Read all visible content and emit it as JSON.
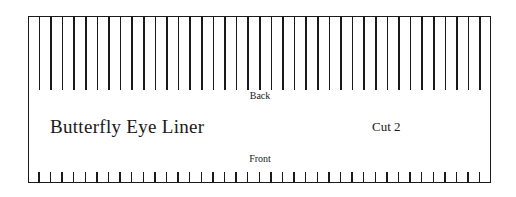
{
  "pattern": {
    "title": "Butterfly Eye Liner",
    "cut_label": "Cut 2",
    "top_label": "Back",
    "bottom_label": "Front",
    "long_line_count": 39,
    "short_tick_count": 39,
    "line_color": "#1a1a1a"
  }
}
